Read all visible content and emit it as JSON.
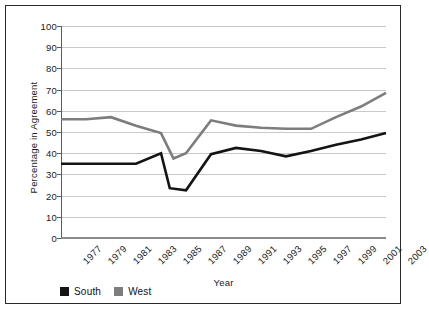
{
  "chart_data": {
    "type": "line",
    "title": "",
    "subtitle": "",
    "xlabel": "Year",
    "ylabel": "Percentage in Agreement",
    "categories": [
      "1977",
      "1979",
      "1981",
      "1983",
      "1985",
      "1987",
      "1989",
      "1991",
      "1993",
      "1995",
      "1997",
      "1999",
      "2001",
      "2003"
    ],
    "x": [
      1977,
      1979,
      1981,
      1983,
      1985,
      1987,
      1989,
      1991,
      1993,
      1995,
      1997,
      1999,
      2001,
      2003
    ],
    "xlim": [
      1977,
      2003
    ],
    "ylim": [
      0,
      100
    ],
    "yticks": [
      0,
      10,
      20,
      30,
      40,
      50,
      60,
      70,
      80,
      90,
      100
    ],
    "xticks": [
      "1977",
      "1979",
      "1981",
      "1983",
      "1985",
      "1987",
      "1989",
      "1991",
      "1993",
      "1995",
      "1997",
      "1999",
      "2001",
      "2003"
    ],
    "grid": true,
    "legend_position": "bottom-left",
    "series": [
      {
        "name": "South",
        "color": "#141414",
        "values": [
          35,
          35,
          35,
          35,
          40,
          22.5,
          39.5,
          42.5,
          41,
          38.5,
          41,
          44,
          46.5,
          49.5
        ]
      },
      {
        "name": "West",
        "color": "#7d7d7d",
        "values": [
          56,
          56,
          57,
          53,
          49.5,
          40,
          55.5,
          53,
          52,
          51.5,
          51.5,
          57,
          62,
          68.5
        ]
      }
    ],
    "notes": {
      "south_dip_low": 22.5,
      "west_dip_low": 37.5,
      "dip_year": "1987"
    }
  },
  "legend": {
    "items": [
      {
        "label": "South",
        "color": "#141414",
        "swatch": "square-black"
      },
      {
        "label": "West",
        "color": "#7d7d7d",
        "swatch": "square-gray"
      }
    ]
  },
  "axes": {
    "y_title": "Percentage in Agreement",
    "x_title": "Year",
    "y_tick_labels": [
      "100",
      "90",
      "80",
      "70",
      "60",
      "50",
      "40",
      "30",
      "20",
      "10",
      "0"
    ],
    "x_tick_labels": [
      "1977",
      "1979",
      "1981",
      "1983",
      "1985",
      "1987",
      "1989",
      "1991",
      "1993",
      "1995",
      "1997",
      "1999",
      "2001",
      "2003"
    ]
  },
  "style": {
    "grid_color": "#c9c9c9",
    "axis_color": "#5c5c5c",
    "frame_color": "#2b2b2b",
    "background": "#ffffff",
    "text_color": "#1a1a1a"
  }
}
